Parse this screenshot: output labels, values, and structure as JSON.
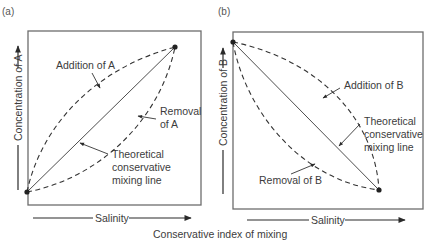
{
  "figure": {
    "x_axis_common_label": "Conservative index of mixing",
    "panels": [
      {
        "id": "a",
        "panel_label": "(a)",
        "y_axis_label": "Concentration of A",
        "x_axis_label": "Salinity",
        "annotations": {
          "addition": "Addition of A",
          "removal_line1": "Removal",
          "removal_line2": "of A",
          "theoretical_line1": "Theoretical",
          "theoretical_line2": "conservative",
          "theoretical_line3": "mixing line"
        },
        "trend": "positive",
        "endpoints": [
          [
            0,
            0
          ],
          [
            1,
            1
          ]
        ]
      },
      {
        "id": "b",
        "panel_label": "(b)",
        "y_axis_label": "Concentration of B",
        "x_axis_label": "Salinity",
        "annotations": {
          "addition": "Addition of B",
          "removal": "Removal of B",
          "theoretical_line1": "Theoretical",
          "theoretical_line2": "conservative",
          "theoretical_line3": "mixing line"
        },
        "trend": "negative",
        "endpoints": [
          [
            0,
            1
          ],
          [
            1,
            0
          ]
        ]
      }
    ]
  },
  "colors": {
    "line": "#333333",
    "frame": "#6d6d6d",
    "text": "#3c3c3c"
  }
}
